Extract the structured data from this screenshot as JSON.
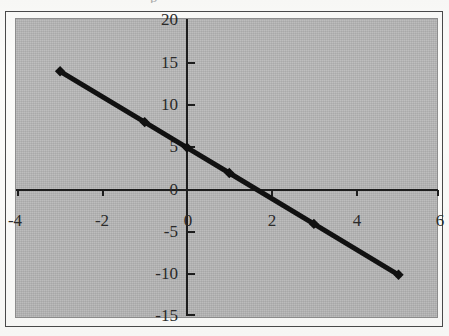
{
  "figure": {
    "plot_background_color": "#b8b8b8",
    "page_background_color": "#fbfbf9",
    "frame_color": "#4a4a4a",
    "series_color": "#111111",
    "top_artifact_text": "p"
  },
  "chart_data": {
    "type": "line",
    "title": "",
    "subtitle": "",
    "xlabel": "",
    "ylabel": "",
    "x": [
      -3,
      -1,
      0,
      1,
      3,
      5
    ],
    "values": [
      14,
      8,
      5,
      2,
      -4,
      -10
    ],
    "series": [
      {
        "name": "",
        "x": [
          -3,
          -1,
          0,
          1,
          3,
          5
        ],
        "values": [
          14,
          8,
          5,
          2,
          -4,
          -10
        ],
        "marker": "diamond",
        "color": "#111111"
      }
    ],
    "xlim": [
      -4,
      6
    ],
    "ylim": [
      -15,
      20
    ],
    "xticks": [
      -4,
      -2,
      0,
      2,
      4,
      6
    ],
    "yticks": [
      20,
      15,
      10,
      5,
      0,
      -5,
      -10,
      -15
    ],
    "xtick_labels": [
      "-4",
      "-2",
      "0",
      "2",
      "4",
      "6"
    ],
    "ytick_labels": [
      "20",
      "15",
      "10",
      "5",
      "0",
      "-5",
      "-10",
      "-15"
    ],
    "grid": false,
    "legend": false,
    "legend_position": "none",
    "annotations": []
  }
}
